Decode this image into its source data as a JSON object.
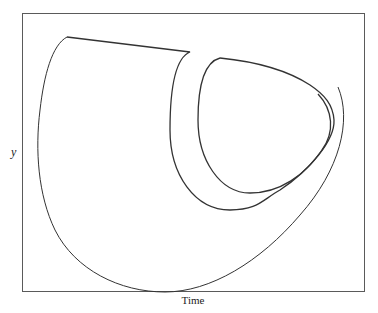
{
  "diagram": {
    "type": "phase-trajectory",
    "xlabel": "Time",
    "ylabel": "y",
    "line_color": "#333333",
    "frame_color": "#5a5a5a",
    "background": "#ffffff"
  }
}
